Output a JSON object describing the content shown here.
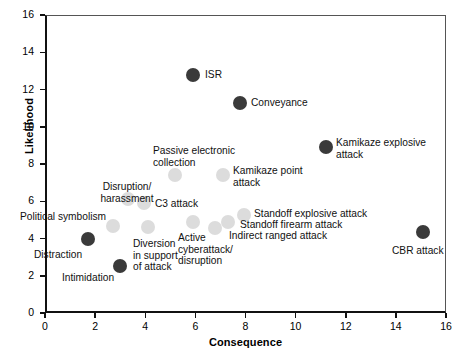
{
  "chart_data": {
    "type": "scatter",
    "title": "",
    "xlabel": "Consequence",
    "ylabel": "Likelihood",
    "xlim": [
      0,
      16
    ],
    "ylim": [
      0,
      16
    ],
    "xticks": [
      0,
      2,
      4,
      6,
      8,
      10,
      12,
      14,
      16
    ],
    "yticks": [
      0,
      2,
      4,
      6,
      8,
      10,
      12,
      14,
      16
    ],
    "grid": false,
    "legend": "none",
    "colors": {
      "dark_marker": "#3a3a3a",
      "light_marker": "#dcdcdc",
      "axis": "#111111",
      "background": "#ffffff"
    },
    "points": [
      {
        "label": "ISR",
        "x": 5.9,
        "y": 12.8,
        "style": "dark"
      },
      {
        "label": "Conveyance",
        "x": 7.8,
        "y": 11.3,
        "style": "dark"
      },
      {
        "label": "Kamikaze explosive attack",
        "x": 11.2,
        "y": 8.9,
        "style": "dark"
      },
      {
        "label": "Passive electronic collection",
        "x": 5.2,
        "y": 7.4,
        "style": "light"
      },
      {
        "label": "Kamikaze point attack",
        "x": 7.1,
        "y": 7.4,
        "style": "light"
      },
      {
        "label": "Disruption/harassment",
        "x": 3.3,
        "y": 6.1,
        "style": "light"
      },
      {
        "label": "C3 attack",
        "x": 3.95,
        "y": 5.9,
        "style": "light"
      },
      {
        "label": "Political symbolism",
        "x": 2.7,
        "y": 4.65,
        "style": "light"
      },
      {
        "label": "Standoff explosive attack",
        "x": 7.95,
        "y": 5.25,
        "style": "light"
      },
      {
        "label": "Standoff firearm attack",
        "x": 7.3,
        "y": 4.9,
        "style": "light"
      },
      {
        "label": "Indirect ranged attack",
        "x": 6.8,
        "y": 4.55,
        "style": "light"
      },
      {
        "label": "Active cyberattack/disruption",
        "x": 5.9,
        "y": 4.9,
        "style": "light"
      },
      {
        "label": "Diversion in support of attack",
        "x": 4.1,
        "y": 4.6,
        "style": "light"
      },
      {
        "label": "Distraction",
        "x": 1.7,
        "y": 4.0,
        "style": "dark"
      },
      {
        "label": "Intimidation",
        "x": 3.0,
        "y": 2.5,
        "style": "dark"
      },
      {
        "label": "CBR attack",
        "x": 15.1,
        "y": 4.35,
        "style": "dark"
      }
    ],
    "labels": [
      {
        "text": "ISR",
        "lines": [
          "ISR"
        ],
        "px": 205,
        "py": 69,
        "align": "right"
      },
      {
        "text": "Conveyance",
        "lines": [
          "Conveyance"
        ],
        "px": 251,
        "py": 97,
        "align": "right"
      },
      {
        "text": "Kamikaze explosive attack",
        "lines": [
          "Kamikaze explosive",
          "attack"
        ],
        "px": 336,
        "py": 137,
        "align": "right"
      },
      {
        "text": "Passive electronic collection",
        "lines": [
          "Passive electronic",
          "collection"
        ],
        "px": 153,
        "py": 145,
        "align": "right"
      },
      {
        "text": "Kamikaze point attack",
        "lines": [
          "Kamikaze point",
          "attack"
        ],
        "px": 233,
        "py": 165,
        "align": "right"
      },
      {
        "text": "Disruption/harassment",
        "lines": [
          "Disruption/",
          "harassment"
        ],
        "px": 127,
        "py": 181,
        "align": "center"
      },
      {
        "text": "C3 attack",
        "lines": [
          "C3 attack"
        ],
        "px": 155,
        "py": 198,
        "align": "right"
      },
      {
        "text": "Political symbolism",
        "lines": [
          "Political symbolism"
        ],
        "px": 20,
        "py": 211,
        "align": "right"
      },
      {
        "text": "Standoff explosive attack",
        "lines": [
          "Standoff explosive attack"
        ],
        "px": 254,
        "py": 208,
        "align": "right"
      },
      {
        "text": "Standoff firearm attack",
        "lines": [
          "Standoff firearm attack"
        ],
        "px": 240,
        "py": 219,
        "align": "right"
      },
      {
        "text": "Indirect ranged attack",
        "lines": [
          "Indirect ranged attack"
        ],
        "px": 229,
        "py": 230,
        "align": "right"
      },
      {
        "text": "Active cyberattack/disruption",
        "lines": [
          "Active",
          "cyberattack/",
          "disruption"
        ],
        "px": 178,
        "py": 232,
        "align": "right"
      },
      {
        "text": "Diversion in support of attack",
        "lines": [
          "Diversion",
          "in support",
          "of attack"
        ],
        "px": 133,
        "py": 238,
        "align": "right"
      },
      {
        "text": "Distraction",
        "lines": [
          "Distraction"
        ],
        "px": 34,
        "py": 249,
        "align": "right"
      },
      {
        "text": "Intimidation",
        "lines": [
          "Intimidation",
          ""
        ],
        "px": 62,
        "py": 272,
        "align": "right"
      },
      {
        "text": "CBR attack",
        "lines": [
          "CBR attack"
        ],
        "px": 392,
        "py": 245,
        "align": "right"
      }
    ]
  },
  "axes": {
    "x_title": "Consequence",
    "y_title": "Likelihood",
    "x_tick_labels": [
      "0",
      "2",
      "4",
      "6",
      "8",
      "10",
      "12",
      "14",
      "16"
    ],
    "y_tick_labels": [
      "0",
      "2",
      "4",
      "6",
      "8",
      "10",
      "12",
      "14",
      "16"
    ]
  }
}
